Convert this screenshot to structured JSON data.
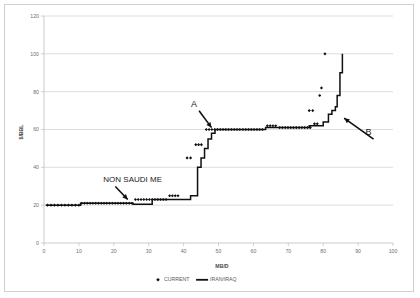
{
  "chart_data": {
    "type": "scatter",
    "title": "",
    "xlabel": "MB/D",
    "ylabel": "$/BBL",
    "xlim": [
      0,
      100
    ],
    "ylim": [
      0,
      120
    ],
    "xticks": [
      0,
      10,
      20,
      30,
      40,
      50,
      60,
      70,
      80,
      90,
      100
    ],
    "yticks": [
      0,
      20,
      40,
      60,
      80,
      100,
      120
    ],
    "grid": "horizontal",
    "legend_position": "bottom",
    "legend": [
      {
        "label": "CURRENT",
        "marker": "diamond",
        "color": "#101010"
      },
      {
        "label": "IRAN/IRAQ",
        "marker": "line",
        "color": "#101010"
      }
    ],
    "annotations": [
      {
        "text": "A",
        "x": 43,
        "y": 72,
        "arrow_to_x": 48,
        "arrow_to_y": 61
      },
      {
        "text": "B",
        "x": 93,
        "y": 57,
        "arrow_to_x": 86,
        "arrow_to_y": 66
      },
      {
        "text": "NON SAUDI ME",
        "x": 17,
        "y": 32,
        "arrow_to_x": 24,
        "arrow_to_y": 23
      }
    ],
    "series": [
      {
        "name": "CURRENT",
        "type": "scatter",
        "marker": "diamond",
        "points": [
          [
            1.0,
            20
          ],
          [
            2.0,
            20
          ],
          [
            3.0,
            20
          ],
          [
            4.0,
            20
          ],
          [
            5.0,
            20
          ],
          [
            6.0,
            20
          ],
          [
            7.0,
            20
          ],
          [
            8.0,
            20
          ],
          [
            9.0,
            20
          ],
          [
            10.0,
            20
          ],
          [
            10.8,
            21
          ],
          [
            11.6,
            21
          ],
          [
            12.4,
            21
          ],
          [
            13.2,
            21
          ],
          [
            14.0,
            21
          ],
          [
            14.8,
            21
          ],
          [
            15.6,
            21
          ],
          [
            16.4,
            21
          ],
          [
            17.2,
            21
          ],
          [
            18.0,
            21
          ],
          [
            18.8,
            21
          ],
          [
            19.6,
            21
          ],
          [
            20.4,
            21
          ],
          [
            21.2,
            21
          ],
          [
            22.0,
            21
          ],
          [
            22.8,
            21
          ],
          [
            23.6,
            21
          ],
          [
            24.4,
            21
          ],
          [
            25.2,
            21
          ],
          [
            26.2,
            23
          ],
          [
            27.0,
            23
          ],
          [
            27.8,
            23
          ],
          [
            28.6,
            23
          ],
          [
            29.4,
            23
          ],
          [
            30.2,
            23
          ],
          [
            31.0,
            23
          ],
          [
            31.8,
            23
          ],
          [
            32.6,
            23
          ],
          [
            33.4,
            23
          ],
          [
            34.2,
            23
          ],
          [
            35.0,
            23
          ],
          [
            36.0,
            25
          ],
          [
            36.8,
            25
          ],
          [
            37.6,
            25
          ],
          [
            38.4,
            25
          ],
          [
            41.0,
            45
          ],
          [
            42.0,
            45
          ],
          [
            43.5,
            52
          ],
          [
            44.3,
            52
          ],
          [
            45.1,
            52
          ],
          [
            46.5,
            60
          ],
          [
            47.3,
            60
          ],
          [
            48.1,
            60
          ],
          [
            48.9,
            60
          ],
          [
            49.7,
            60
          ],
          [
            50.5,
            60
          ],
          [
            51.3,
            60
          ],
          [
            52.1,
            60
          ],
          [
            52.9,
            60
          ],
          [
            53.7,
            60
          ],
          [
            54.5,
            60
          ],
          [
            55.3,
            60
          ],
          [
            56.1,
            60
          ],
          [
            57.0,
            60
          ],
          [
            57.8,
            60
          ],
          [
            58.6,
            60
          ],
          [
            59.4,
            60
          ],
          [
            60.2,
            60
          ],
          [
            61.0,
            60
          ],
          [
            61.8,
            60
          ],
          [
            62.6,
            60
          ],
          [
            64.0,
            62
          ],
          [
            64.8,
            62
          ],
          [
            65.6,
            62
          ],
          [
            66.4,
            62
          ],
          [
            67.5,
            61
          ],
          [
            68.3,
            61
          ],
          [
            69.1,
            61
          ],
          [
            69.9,
            61
          ],
          [
            70.7,
            61
          ],
          [
            71.5,
            61
          ],
          [
            72.3,
            61
          ],
          [
            73.1,
            61
          ],
          [
            73.9,
            61
          ],
          [
            74.7,
            61
          ],
          [
            75.5,
            61
          ],
          [
            76.3,
            61
          ],
          [
            77.5,
            63
          ],
          [
            78.3,
            63
          ],
          [
            76.0,
            70
          ],
          [
            77.0,
            70
          ],
          [
            79.0,
            78
          ],
          [
            79.5,
            82
          ],
          [
            80.5,
            100
          ]
        ]
      },
      {
        "name": "IRAN/IRAQ",
        "type": "line",
        "points": [
          [
            0.5,
            20
          ],
          [
            10.5,
            20
          ],
          [
            10.5,
            21
          ],
          [
            25.5,
            21
          ],
          [
            25.5,
            20.5
          ],
          [
            31.0,
            20.5
          ],
          [
            31.0,
            23
          ],
          [
            42.0,
            23
          ],
          [
            42.0,
            25
          ],
          [
            44.0,
            25
          ],
          [
            44.0,
            40
          ],
          [
            45.0,
            40
          ],
          [
            45.0,
            45
          ],
          [
            46.0,
            45
          ],
          [
            46.0,
            50
          ],
          [
            47.0,
            50
          ],
          [
            47.0,
            55
          ],
          [
            48.0,
            55
          ],
          [
            48.0,
            58
          ],
          [
            49.0,
            58
          ],
          [
            49.0,
            60
          ],
          [
            63.5,
            60
          ],
          [
            63.5,
            61
          ],
          [
            76.0,
            61
          ],
          [
            76.0,
            62
          ],
          [
            80.0,
            62
          ],
          [
            80.0,
            64
          ],
          [
            81.5,
            64
          ],
          [
            81.5,
            68
          ],
          [
            82.5,
            68
          ],
          [
            82.5,
            70
          ],
          [
            83.5,
            70
          ],
          [
            83.5,
            72
          ],
          [
            84.0,
            72
          ],
          [
            84.0,
            78
          ],
          [
            84.8,
            78
          ],
          [
            84.8,
            90
          ],
          [
            85.5,
            90
          ],
          [
            85.5,
            100
          ]
        ]
      }
    ]
  }
}
